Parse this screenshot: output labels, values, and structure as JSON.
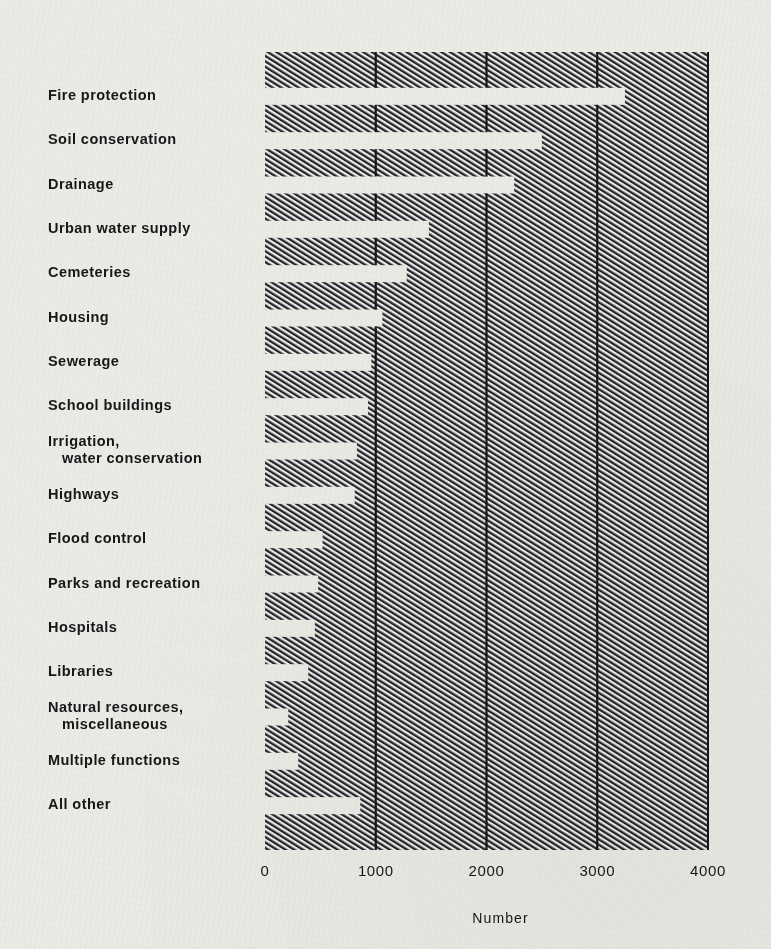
{
  "chart_data": {
    "type": "bar",
    "orientation": "horizontal",
    "title": "",
    "xlabel": "Number",
    "ylabel": "",
    "xlim": [
      0,
      4000
    ],
    "xticks": [
      0,
      1000,
      2000,
      3000,
      4000
    ],
    "xtick_labels": [
      "0",
      "1000",
      "2000",
      "3000",
      "4000"
    ],
    "grid": true,
    "grid_axis": "x",
    "legend": null,
    "bar_style": "white bars cut out of a diagonally hatched field",
    "categories": [
      "Fire protection",
      "Soil conservation",
      "Drainage",
      "Urban water supply",
      "Cemeteries",
      "Housing",
      "Sewerage",
      "School buildings",
      "Irrigation, water conservation",
      "Highways",
      "Flood control",
      "Parks and recreation",
      "Hospitals",
      "Libraries",
      "Natural resources, miscellaneous",
      "Multiple functions",
      "All other"
    ],
    "values": [
      3250,
      2500,
      2250,
      1480,
      1280,
      1060,
      960,
      930,
      830,
      810,
      520,
      480,
      450,
      390,
      210,
      300,
      860
    ]
  },
  "labels": [
    {
      "line1": "Fire protection",
      "line2": ""
    },
    {
      "line1": "Soil conservation",
      "line2": ""
    },
    {
      "line1": "Drainage",
      "line2": ""
    },
    {
      "line1": "Urban water supply",
      "line2": ""
    },
    {
      "line1": "Cemeteries",
      "line2": ""
    },
    {
      "line1": "Housing",
      "line2": ""
    },
    {
      "line1": "Sewerage",
      "line2": ""
    },
    {
      "line1": "School buildings",
      "line2": ""
    },
    {
      "line1": "Irrigation,",
      "line2": "water conservation"
    },
    {
      "line1": "Highways",
      "line2": ""
    },
    {
      "line1": "Flood control",
      "line2": ""
    },
    {
      "line1": "Parks and recreation",
      "line2": ""
    },
    {
      "line1": "Hospitals",
      "line2": ""
    },
    {
      "line1": "Libraries",
      "line2": ""
    },
    {
      "line1": "Natural resources,",
      "line2": "miscellaneous"
    },
    {
      "line1": "Multiple functions",
      "line2": ""
    },
    {
      "line1": "All other",
      "line2": ""
    }
  ],
  "colors": {
    "paper": "#eceae5",
    "ink": "#17171a",
    "hatch": "#2b2b2b",
    "bar_fill": "#f2f0ec"
  }
}
